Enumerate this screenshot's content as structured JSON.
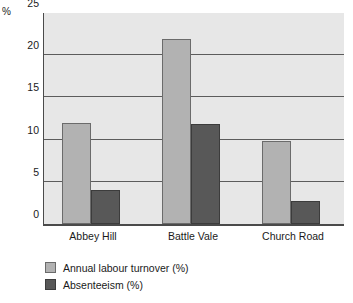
{
  "chart_data": {
    "type": "bar",
    "title": "",
    "subtitle": "",
    "xlabel": "",
    "ylabel": "%",
    "unit_label": "%",
    "categories": [
      "Abbey Hill",
      "Battle Vale",
      "Church Road"
    ],
    "series": [
      {
        "name": "Annual labour turnover (%)",
        "color": "#b2b2b2",
        "values": [
          12,
          21.9,
          9.8
        ]
      },
      {
        "name": "Absenteeism (%)",
        "color": "#585858",
        "values": [
          4,
          11.8,
          2.7
        ]
      }
    ],
    "ylim": [
      0,
      25
    ],
    "yticks": [
      0,
      5,
      10,
      15,
      20,
      25
    ],
    "ytick_labels": [
      "0",
      "5",
      "10",
      "15",
      "20",
      "25"
    ],
    "grid": "horizontal",
    "legend_position": "bottom-left",
    "plot_background": "#e7e7e7",
    "axis_color": "#4a4a4a",
    "gridline_color": "#5c5c5c"
  }
}
